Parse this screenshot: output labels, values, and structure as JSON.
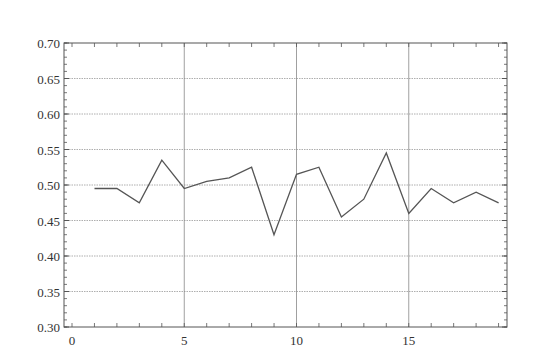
{
  "chart_data": {
    "type": "line",
    "title": "",
    "xlabel": "",
    "ylabel": "",
    "xlim": [
      -0.3,
      19.3
    ],
    "ylim": [
      0.3,
      0.7
    ],
    "grid": true,
    "legend": null,
    "x_ticks": [
      0,
      5,
      10,
      15
    ],
    "x_tick_labels": [
      "0",
      "5",
      "10",
      "15"
    ],
    "y_ticks": [
      0.3,
      0.35,
      0.4,
      0.45,
      0.5,
      0.55,
      0.6,
      0.65,
      0.7
    ],
    "y_tick_labels": [
      "0.30",
      "0.35",
      "0.40",
      "0.45",
      "0.50",
      "0.55",
      "0.60",
      "0.65",
      "0.70"
    ],
    "x": [
      1,
      2,
      3,
      4,
      5,
      6,
      7,
      8,
      9,
      10,
      11,
      12,
      13,
      14,
      15,
      16,
      17,
      18,
      19
    ],
    "series": [
      {
        "name": "series-1",
        "values": [
          0.495,
          0.495,
          0.475,
          0.535,
          0.495,
          0.505,
          0.51,
          0.525,
          0.43,
          0.515,
          0.525,
          0.455,
          0.48,
          0.545,
          0.46,
          0.495,
          0.475,
          0.49,
          0.475
        ],
        "color": "#555555"
      }
    ]
  },
  "colors": {
    "axis": "#555555",
    "grid": "#999999",
    "line": "#555555"
  }
}
